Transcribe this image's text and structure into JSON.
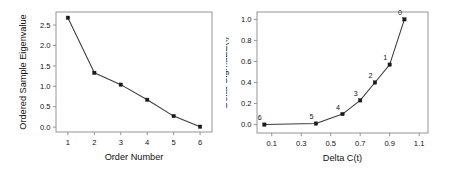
{
  "figure": {
    "background_color": "#ffffff",
    "line_color": "#3a3a3a",
    "marker_color": "#1a1a1a",
    "axis_color": "#8a8a8a",
    "text_color": "#111111"
  },
  "chart_data": [
    {
      "type": "line",
      "panel": "left",
      "title": "",
      "xlabel": "Order Number",
      "ylabel": "Ordered Sample Eigenvalue",
      "x": [
        1,
        2,
        3,
        4,
        5,
        6
      ],
      "values": [
        2.68,
        1.33,
        1.04,
        0.67,
        0.27,
        0.01
      ],
      "xlim": [
        0.55,
        6.45
      ],
      "ylim": [
        -0.12,
        2.82
      ],
      "xticks": [
        1,
        2,
        3,
        4,
        5,
        6
      ],
      "xticklabels": [
        "1",
        "2",
        "3",
        "4",
        "5",
        "6"
      ],
      "yticks": [
        0.0,
        0.5,
        1.0,
        1.5,
        2.0,
        2.5
      ],
      "yticklabels": [
        "0.0",
        "0.5",
        "1.0",
        "1.5",
        "2.0",
        "2.5"
      ],
      "grid": false,
      "legend": "none",
      "markers": "filled-square"
    },
    {
      "type": "line",
      "panel": "right",
      "title": "",
      "xlabel": "Delta C(t)",
      "ylabel": "Delta-SigmaEE(t)",
      "x": [
        0.05,
        0.4,
        0.58,
        0.7,
        0.8,
        0.9,
        1.0
      ],
      "values": [
        0.0,
        0.01,
        0.1,
        0.23,
        0.4,
        0.57,
        1.0
      ],
      "point_labels": [
        "6",
        "5",
        "4",
        "3",
        "2",
        "1",
        "0"
      ],
      "xlim": [
        0.0,
        1.16
      ],
      "ylim": [
        -0.08,
        1.07
      ],
      "xticks": [
        0.1,
        0.3,
        0.5,
        0.7,
        0.9,
        1.1
      ],
      "xticklabels": [
        "0.1",
        "0.3",
        "0.5",
        "0.7",
        "0.9",
        "1.1"
      ],
      "yticks": [
        0.0,
        0.2,
        0.4,
        0.6,
        0.8,
        1.0
      ],
      "yticklabels": [
        "0.0",
        "0.2",
        "0.4",
        "0.6",
        "0.8",
        "1.0"
      ],
      "grid": false,
      "legend": "none",
      "markers": "filled-square"
    }
  ]
}
